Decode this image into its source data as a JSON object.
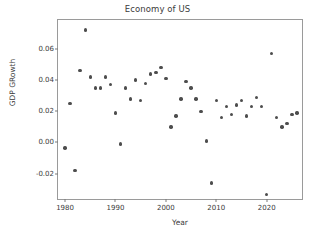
{
  "chart_data": {
    "type": "scatter",
    "title": "Economy of US",
    "xlabel": "Year",
    "ylabel": "GDP GRowth",
    "xlim": [
      1978.6,
      2027.4
    ],
    "ylim": [
      -0.0375,
      0.0785
    ],
    "grid": false,
    "legend": null,
    "marker_color": "#4d4d4d",
    "xticks": [
      1980,
      1990,
      2000,
      2010,
      2020
    ],
    "xtick_labels": [
      "1980",
      "1990",
      "2000",
      "2010",
      "2020"
    ],
    "yticks": [
      -0.02,
      0.0,
      0.02,
      0.04,
      0.06
    ],
    "ytick_labels": [
      "-0.02",
      "0.00",
      "0.02",
      "0.04",
      "0.06"
    ],
    "x": [
      1980,
      1981,
      1982,
      1983,
      1984,
      1985,
      1986,
      1987,
      1988,
      1989,
      1990,
      1991,
      1992,
      1993,
      1994,
      1995,
      1996,
      1997,
      1998,
      1999,
      2000,
      2001,
      2002,
      2003,
      2004,
      2005,
      2006,
      2007,
      2008,
      2009,
      2010,
      2011,
      2012,
      2013,
      2014,
      2015,
      2016,
      2017,
      2018,
      2019,
      2020,
      2021,
      2022,
      2023,
      2024,
      2025,
      2026
    ],
    "y": [
      -0.0035,
      0.025,
      -0.018,
      0.046,
      0.072,
      0.042,
      0.035,
      0.035,
      0.042,
      0.037,
      0.019,
      -0.001,
      0.035,
      0.028,
      0.04,
      0.027,
      0.038,
      0.044,
      0.045,
      0.048,
      0.041,
      0.01,
      0.017,
      0.028,
      0.039,
      0.035,
      0.028,
      0.02,
      0.001,
      -0.026,
      0.027,
      0.016,
      0.023,
      0.018,
      0.024,
      0.027,
      0.017,
      0.023,
      0.029,
      0.023,
      -0.0335,
      0.057,
      0.016,
      0.01,
      0.012,
      0.018,
      0.019
    ],
    "series_name": "GDP Growth",
    "n_points": 47
  }
}
